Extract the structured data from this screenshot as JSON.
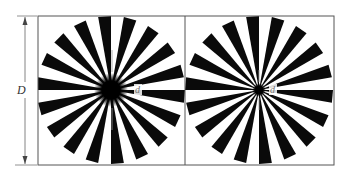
{
  "figure": {
    "type": "siemens-star-comparison",
    "labels": {
      "outer_dimension": "D",
      "left_blur_diameter": "d",
      "right_blur_diameter": "d"
    },
    "colors": {
      "spoke": "#0a0a0a",
      "background": "#ffffff",
      "frame": "#555555",
      "dimension_line": "#666666",
      "center_marker": "#9a9a9a"
    },
    "frame": {
      "x": 38,
      "y": 16,
      "width": 296,
      "height": 149,
      "divider_x": 185
    },
    "dimension_line": {
      "x": 25,
      "y_top": 16,
      "y_bottom": 165,
      "label_x": 17,
      "label_y": 93
    },
    "stars": [
      {
        "name": "left-star",
        "cx": 111,
        "cy": 90,
        "outer_radius": 74,
        "spoke_count": 18,
        "spoke_width_deg": 10,
        "first_spoke_center_deg": -5,
        "blur_radius": 16,
        "label_x": 137,
        "label_y": 93
      },
      {
        "name": "right-star",
        "cx": 259,
        "cy": 90,
        "outer_radius": 74,
        "spoke_count": 18,
        "spoke_width_deg": 10,
        "first_spoke_center_deg": -5,
        "blur_radius": 5,
        "label_x": 271,
        "label_y": 93
      }
    ]
  }
}
